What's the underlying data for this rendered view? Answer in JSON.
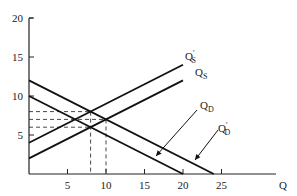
{
  "chart_data": {
    "type": "line",
    "title": "",
    "xlabel": "Q",
    "ylabel": "",
    "xlim": [
      0,
      28
    ],
    "ylim": [
      0,
      20
    ],
    "x_ticks": [
      5,
      10,
      15,
      20,
      25
    ],
    "y_ticks": [
      5,
      10,
      15,
      20
    ],
    "x_tick_labels": [
      "5",
      "10",
      "15",
      "20",
      "25"
    ],
    "y_tick_labels": [
      "5",
      "10",
      "15",
      "20"
    ],
    "grid": false,
    "series": [
      {
        "name": "Q_S",
        "label_main": "Q",
        "label_sub": "S",
        "label_prime": "",
        "points": [
          [
            0,
            2
          ],
          [
            20,
            12
          ]
        ]
      },
      {
        "name": "Q'_S",
        "label_main": "Q",
        "label_sub": "S",
        "label_prime": "'",
        "points": [
          [
            0,
            4
          ],
          [
            20,
            14
          ]
        ]
      },
      {
        "name": "Q_D",
        "label_main": "Q",
        "label_sub": "D",
        "label_prime": "",
        "points": [
          [
            0,
            10
          ],
          [
            20,
            0
          ]
        ]
      },
      {
        "name": "Q'_D",
        "label_main": "Q",
        "label_sub": "D",
        "label_prime": "'",
        "points": [
          [
            0,
            12
          ],
          [
            24,
            0
          ]
        ]
      }
    ],
    "equilibria": [
      {
        "q": 8,
        "p": 6,
        "curves": [
          "Q_S",
          "Q_D"
        ]
      },
      {
        "q": 10,
        "p": 7,
        "curves": [
          "Q_S",
          "Q'_D"
        ]
      },
      {
        "q": 8,
        "p": 8,
        "curves": [
          "Q'_S",
          "Q'_D"
        ]
      }
    ],
    "dashed_guides": {
      "horizontal_p": [
        6,
        7,
        8
      ],
      "vertical_q": [
        8,
        10
      ]
    }
  }
}
